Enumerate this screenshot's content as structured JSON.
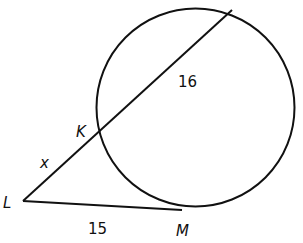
{
  "diagram": {
    "type": "geometry-secant-tangent",
    "points": {
      "K": "K",
      "L": "L",
      "M": "M"
    },
    "segments": {
      "LK": "x",
      "secant_inside": "16",
      "LM": "15"
    },
    "colors": {
      "stroke": "#111111",
      "background": "#ffffff"
    }
  }
}
